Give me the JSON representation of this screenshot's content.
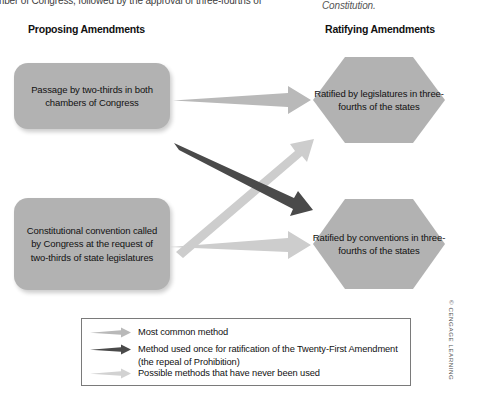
{
  "figure": {
    "body_text_fragment": "mber of Congress, followed by the approval of three-fourths of",
    "constitution_fragment": "Constitution.",
    "copyright": "© CENGAGE LEARNING"
  },
  "columns": {
    "proposing_heading": "Proposing Amendments",
    "ratifying_heading": "Ratifying Amendments"
  },
  "proposing": [
    {
      "id": "passage",
      "text": "Passage by two-thirds in both chambers of Congress"
    },
    {
      "id": "convention",
      "text": "Constitutional convention called by Congress at the request of two-thirds of state legislatures"
    }
  ],
  "ratifying": [
    {
      "id": "legislatures",
      "text": "Ratified by legislatures in three-fourths of the states"
    },
    {
      "id": "conventions",
      "text": "Ratified by conventions in three-fourths of the states"
    }
  ],
  "legend": {
    "items": [
      {
        "id": "most-common",
        "label": "Most common method",
        "label_line2": "",
        "color": "#b9b9b9"
      },
      {
        "id": "used-once",
        "label": "Method used once for ratification of the Twenty-First Amendment",
        "label_line2": "(the repeal of Prohibition)",
        "color": "#4a4a4a"
      },
      {
        "id": "never-used",
        "label": "Possible methods that have never been used",
        "label_line2": "",
        "color": "#d2d2d2"
      }
    ]
  },
  "arrows": [
    {
      "id": "passage-to-legislatures",
      "from": "passage",
      "to": "legislatures",
      "method": "most-common",
      "color": "#b9b9b9"
    },
    {
      "id": "passage-to-conventions",
      "from": "passage",
      "to": "conventions",
      "method": "used-once",
      "color": "#4a4a4a"
    },
    {
      "id": "convention-to-legislatures",
      "from": "convention",
      "to": "legislatures",
      "method": "never-used",
      "color": "#cdcdcd"
    },
    {
      "id": "convention-to-conventions",
      "from": "convention",
      "to": "conventions",
      "method": "never-used",
      "color": "#cdcdcd"
    }
  ],
  "colors": {
    "box_fill": "#b2b2b2",
    "hex_fill": "#b2b2b2",
    "legend_border": "#7a7a7a",
    "dark_arrow": "#4a4a4a",
    "light_arrow": "#cdcdcd",
    "mid_arrow": "#b9b9b9"
  }
}
